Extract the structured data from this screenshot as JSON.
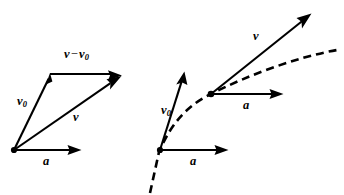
{
  "figure": {
    "background_color": "#ffffff",
    "stroke_color": "#000000",
    "width": 344,
    "height": 195
  },
  "panels": [
    {
      "id": "left-panel",
      "name": "vector-triangle-panel",
      "description": "Vector triangle showing v0 plus delta-v equals v",
      "origin": {
        "x": 14,
        "y": 150
      },
      "vectors": [
        {
          "name": "v0-vector",
          "label": "v",
          "subscript": "0",
          "from": {
            "x": 14,
            "y": 150
          },
          "to": {
            "x": 50,
            "y": 76
          },
          "style": "solid",
          "label_position": {
            "x": 17,
            "y": 95
          }
        },
        {
          "name": "delta-v-vector",
          "label": "v",
          "operator": "−",
          "label2": "v",
          "subscript2": "0",
          "from": {
            "x": 50,
            "y": 74
          },
          "to": {
            "x": 121,
            "y": 74
          },
          "style": "solid",
          "label_position": {
            "x": 64,
            "y": 48
          }
        },
        {
          "name": "v-vector",
          "label": "v",
          "from": {
            "x": 14,
            "y": 150
          },
          "to": {
            "x": 121,
            "y": 76
          },
          "style": "solid",
          "label_position": {
            "x": 73,
            "y": 111
          }
        },
        {
          "name": "a-vector",
          "label": "a",
          "from": {
            "x": 14,
            "y": 150
          },
          "to": {
            "x": 81,
            "y": 150
          },
          "style": "solid",
          "label_position": {
            "x": 43,
            "y": 156
          }
        }
      ]
    },
    {
      "id": "right-panel",
      "name": "trajectory-panel",
      "description": "Curved trajectory with tangent velocity vectors and acceleration vectors at two points",
      "points": [
        {
          "name": "trajectory-point-1",
          "x": 160,
          "y": 150
        },
        {
          "name": "trajectory-point-2",
          "x": 211,
          "y": 94
        }
      ],
      "curve": {
        "name": "trajectory-curve",
        "style": "dashed",
        "path": "M 150,193 L 160,150 C 175,118 192,103 211,94 C 245,77 295,57 336,50"
      },
      "vectors": [
        {
          "name": "v0-vector",
          "label": "v",
          "subscript": "0",
          "from": {
            "x": 160,
            "y": 150
          },
          "to": {
            "x": 184,
            "y": 74
          },
          "style": "solid",
          "label_position": {
            "x": 161,
            "y": 104
          }
        },
        {
          "name": "a-vector-1",
          "label": "a",
          "from": {
            "x": 160,
            "y": 150
          },
          "to": {
            "x": 228,
            "y": 150
          },
          "style": "solid",
          "label_position": {
            "x": 190,
            "y": 156
          }
        },
        {
          "name": "v-vector",
          "label": "v",
          "from": {
            "x": 211,
            "y": 94
          },
          "to": {
            "x": 311,
            "y": 14
          },
          "style": "solid",
          "label_position": {
            "x": 253,
            "y": 36
          }
        },
        {
          "name": "a-vector-2",
          "label": "a",
          "from": {
            "x": 211,
            "y": 94
          },
          "to": {
            "x": 283,
            "y": 94
          },
          "style": "solid",
          "label_position": {
            "x": 243,
            "y": 100
          }
        }
      ]
    }
  ],
  "labels": {
    "v": "v",
    "a": "a",
    "zero_subscript": "0",
    "minus": "−"
  }
}
